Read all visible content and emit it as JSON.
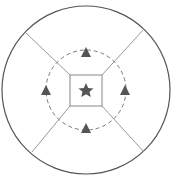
{
  "diagram": {
    "type": "concentric-zones",
    "outer_circle": {
      "cx": 86,
      "cy": 90,
      "r": 84,
      "stroke": "#555555"
    },
    "dashed_circle": {
      "cx": 86,
      "cy": 90,
      "r": 40,
      "stroke": "#777777"
    },
    "center_square": {
      "x": 70,
      "y": 75,
      "w": 32,
      "h": 31,
      "stroke": "#888888"
    },
    "center_symbol": "star",
    "markers": [
      {
        "position": "top",
        "symbol": "triangle"
      },
      {
        "position": "right",
        "symbol": "triangle"
      },
      {
        "position": "bottom",
        "symbol": "triangle"
      },
      {
        "position": "left",
        "symbol": "triangle"
      }
    ],
    "divider_lines": 4,
    "symbol_color": "#555555",
    "line_color": "#999999"
  }
}
